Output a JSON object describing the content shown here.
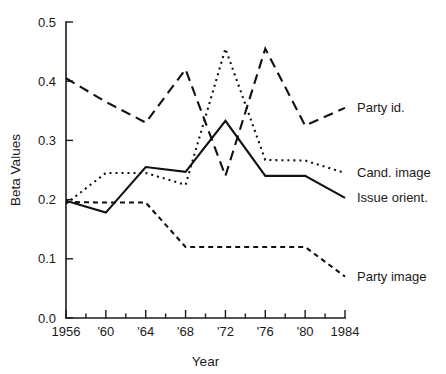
{
  "chart_data": {
    "type": "line",
    "title": "",
    "xlabel": "Year",
    "ylabel": "Beta Values",
    "x": [
      1956,
      1960,
      1964,
      1968,
      1972,
      1976,
      1980,
      1984
    ],
    "xtick_labels": [
      "1956",
      "'60",
      "'64",
      "'68",
      "'72",
      "'76",
      "'80",
      "1984"
    ],
    "xlim": [
      1956,
      1984
    ],
    "ylim": [
      0.0,
      0.5
    ],
    "ytick_labels": [
      "0.0",
      "0.1",
      "0.2",
      "0.3",
      "0.4",
      "0.5"
    ],
    "ytick_values": [
      0.0,
      0.1,
      0.2,
      0.3,
      0.4,
      0.5
    ],
    "minor_xticks_every": 2,
    "grid": false,
    "legend_position": "right-inline",
    "series": [
      {
        "name": "Party id.",
        "label": "Party id.",
        "line_style": "long-dash",
        "dasharray": "10,6",
        "color": "#111111",
        "values": [
          0.405,
          0.365,
          0.33,
          0.42,
          0.24,
          0.455,
          0.325,
          0.355
        ],
        "label_x": 1984,
        "label_y": 0.355
      },
      {
        "name": "Cand. image",
        "label": "Cand. image",
        "line_style": "dotted",
        "dasharray": "2,4",
        "color": "#111111",
        "values": [
          0.193,
          0.245,
          0.245,
          0.225,
          0.455,
          0.267,
          0.266,
          0.245
        ],
        "label_x": 1984,
        "label_y": 0.245
      },
      {
        "name": "Issue orient.",
        "label": "Issue orient.",
        "line_style": "solid",
        "dasharray": "",
        "color": "#111111",
        "values": [
          0.198,
          0.178,
          0.255,
          0.247,
          0.333,
          0.24,
          0.24,
          0.203
        ],
        "label_x": 1984,
        "label_y": 0.203
      },
      {
        "name": "Party image",
        "label": "Party image",
        "line_style": "short-dash",
        "dasharray": "5,4",
        "color": "#111111",
        "values": [
          0.196,
          0.195,
          0.195,
          0.12,
          0.12,
          0.12,
          0.12,
          0.07
        ],
        "label_x": 1984,
        "label_y": 0.07
      }
    ]
  }
}
